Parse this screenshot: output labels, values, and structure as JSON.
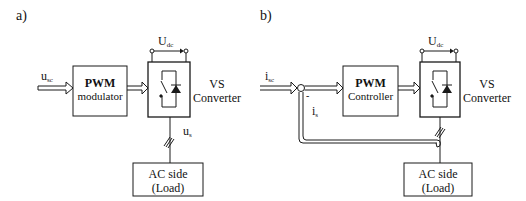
{
  "panel_a": {
    "label": "a)",
    "input_signal": {
      "main": "u",
      "sub": "sc"
    },
    "pwm_block": {
      "line1": "PWM",
      "line2": "modulator"
    },
    "converter": {
      "line1": "VS",
      "line2": "Converter"
    },
    "dc_voltage": {
      "main": "U",
      "sub": "dc"
    },
    "output_signal": {
      "main": "u",
      "sub": "s"
    },
    "load_block": {
      "line1": "AC side",
      "line2": "(Load)"
    }
  },
  "panel_b": {
    "label": "b)",
    "input_signal": {
      "main": "i",
      "sub": "sc"
    },
    "summing_sign": "-",
    "feedback_signal": {
      "main": "i",
      "sub": "s"
    },
    "pwm_block": {
      "line1": "PWM",
      "line2": "Controller"
    },
    "converter": {
      "line1": "VS",
      "line2": "Converter"
    },
    "dc_voltage": {
      "main": "U",
      "sub": "dc"
    },
    "load_block": {
      "line1": "AC side",
      "line2": "(Load)"
    }
  },
  "colors": {
    "line": "#1a1a1a",
    "background": "#ffffff"
  }
}
